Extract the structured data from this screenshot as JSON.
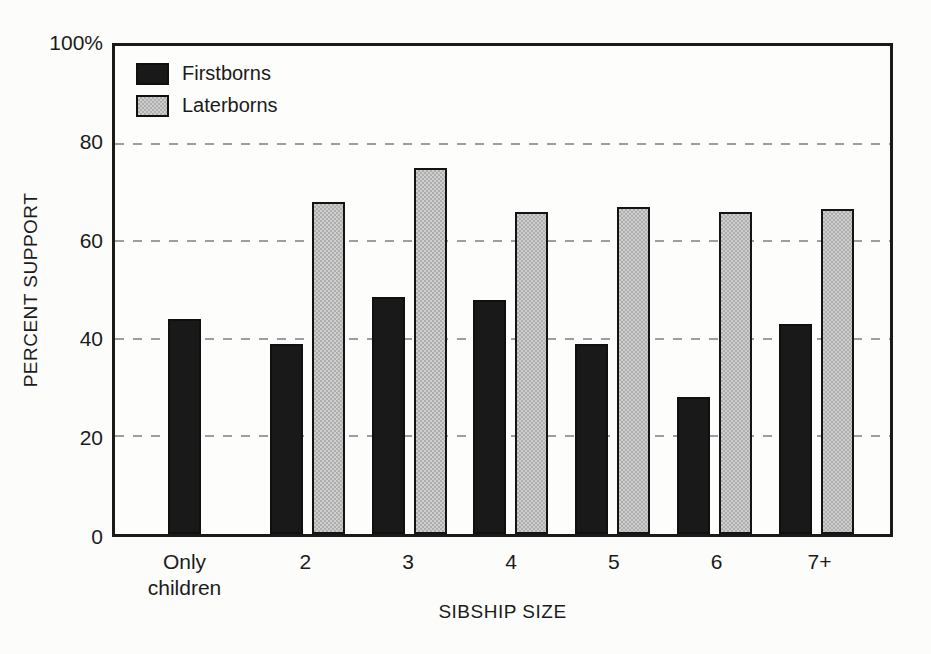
{
  "figure": {
    "background_color": "#fcfcfb",
    "frame_color": "#1a1a1a",
    "gridline_color": "#9e9e9e",
    "text_color": "#1b1b1b"
  },
  "chart_data": {
    "type": "bar",
    "title": "",
    "xlabel": "SIBSHIP SIZE",
    "ylabel": "PERCENT SUPPORT",
    "categories": [
      "Only children",
      "2",
      "3",
      "4",
      "5",
      "6",
      "7+"
    ],
    "series": [
      {
        "name": "Firstborns",
        "color": "#191919",
        "pattern": "solid",
        "values": [
          44,
          39,
          48.5,
          48,
          39,
          28,
          43
        ]
      },
      {
        "name": "Laterborns",
        "color": "#bdbdbd",
        "pattern": "stipple",
        "values": [
          null,
          68,
          75,
          66,
          67,
          66,
          66.5
        ]
      }
    ],
    "ylim": [
      0,
      100
    ],
    "yticks": [
      {
        "value": 100,
        "label": "100%"
      },
      {
        "value": 80,
        "label": "80"
      },
      {
        "value": 60,
        "label": "60"
      },
      {
        "value": 40,
        "label": "40"
      },
      {
        "value": 20,
        "label": "20"
      },
      {
        "value": 0,
        "label": "0"
      }
    ],
    "gridlines": {
      "values": [
        20,
        40,
        60,
        80
      ],
      "style": "dashed"
    },
    "legend": {
      "position": "top-left",
      "entries": [
        "Firstborns",
        "Laterborns"
      ]
    }
  }
}
